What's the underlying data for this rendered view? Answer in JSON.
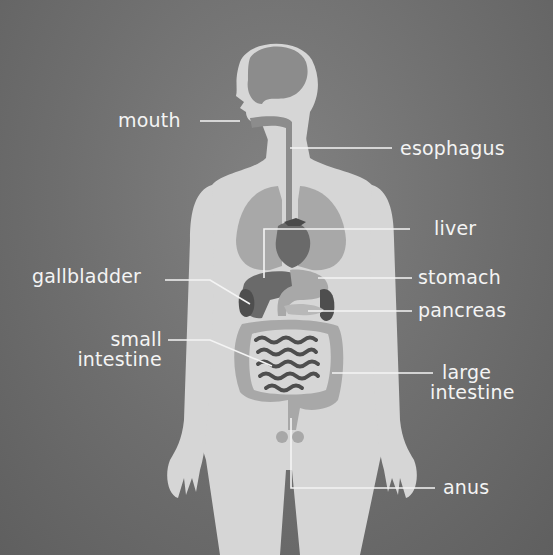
{
  "diagram": {
    "type": "labeled anatomical diagram",
    "colors": {
      "background": "#6e6e6e",
      "body": "#d6d6d6",
      "organ_light": "#a8a8a8",
      "organ_mid": "#8c8c8c",
      "organ_dark": "#5a5a5a",
      "label_text": "#f4f4f4",
      "leader_line": "#f4f4f4"
    },
    "labels": {
      "mouth": "mouth",
      "esophagus": "esophagus",
      "liver": "liver",
      "gallbladder": "gallbladder",
      "stomach": "stomach",
      "pancreas": "pancreas",
      "small_intestine_1": "small",
      "small_intestine_2": "intestine",
      "large_intestine_1": "large",
      "large_intestine_2": "intestine",
      "anus": "anus"
    }
  }
}
